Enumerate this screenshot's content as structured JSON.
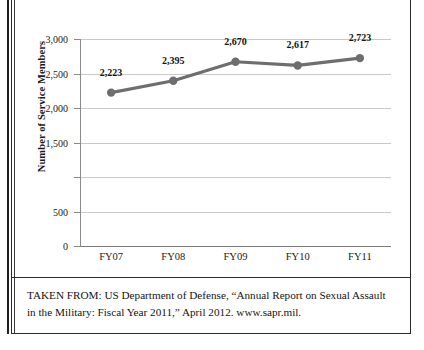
{
  "figure": {
    "caption": "TAKEN FROM: US Department of Defense, “Annual Report on Sexual Assault in the Military: Fiscal Year 2011,” April 2012. www.sapr.mil."
  },
  "chart_data": {
    "type": "line",
    "title": "",
    "xlabel": "",
    "ylabel": "Number of Service Members",
    "categories": [
      "FY07",
      "FY08",
      "FY09",
      "FY10",
      "FY11"
    ],
    "values": [
      2223,
      2395,
      2670,
      2617,
      2723
    ],
    "point_labels": [
      "2,223",
      "2,395",
      "2,670",
      "2,617",
      "2,723"
    ],
    "ylim": [
      0,
      3000
    ],
    "ytick_values": [
      0,
      500,
      1000,
      1500,
      2000,
      2500,
      3000
    ],
    "ytick_labels": [
      "0",
      "500",
      "",
      "1,500",
      "2,000",
      "2,500",
      "3,000"
    ],
    "grid": true,
    "legend": false,
    "series_color": "#6e6e6e",
    "marker": "circle",
    "gridline_color": "#c9c9c9",
    "axis_color": "#8a8a8a"
  }
}
